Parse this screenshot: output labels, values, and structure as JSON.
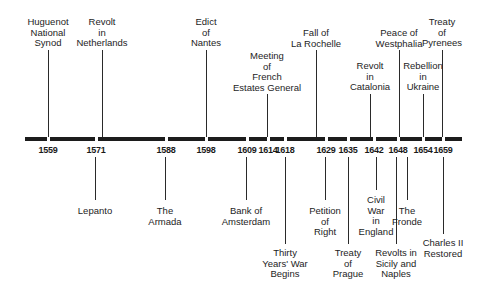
{
  "axis": {
    "start_x": 25,
    "end_x": 462,
    "ticks": [
      {
        "year": "1559",
        "x": 48
      },
      {
        "year": "1571",
        "x": 96
      },
      {
        "year": "1588",
        "x": 166
      },
      {
        "year": "1598",
        "x": 206
      },
      {
        "year": "1609",
        "x": 247
      },
      {
        "year": "1614",
        "x": 268
      },
      {
        "year": "1618",
        "x": 285
      },
      {
        "year": "1629",
        "x": 326
      },
      {
        "year": "1635",
        "x": 348
      },
      {
        "year": "1642",
        "x": 374
      },
      {
        "year": "1648",
        "x": 398
      },
      {
        "year": "1654",
        "x": 423
      },
      {
        "year": "1659",
        "x": 443
      }
    ]
  },
  "events_above": [
    {
      "text": "Huguenot\nNational\nSynod",
      "year": "1559",
      "x": 48,
      "text_top": 19,
      "line_top": 50,
      "line_bottom": 137
    },
    {
      "text": "Revolt\nin\nNetherlands",
      "year": "1571",
      "x": 102,
      "text_top": 19,
      "line_top": 50,
      "line_bottom": 137
    },
    {
      "text": "Edict\nof\nNantes",
      "year": "1598",
      "x": 206,
      "text_top": 19,
      "line_top": 50,
      "line_bottom": 137
    },
    {
      "text": "Meeting\nof\nFrench\nEstates General",
      "year": "1614",
      "x": 267,
      "text_top": 50,
      "line_top": 94,
      "line_bottom": 137
    },
    {
      "text": "Fall of\nLa Rochelle",
      "year": "1629",
      "x": 316,
      "text_top": 29,
      "line_top": 50,
      "line_bottom": 137
    },
    {
      "text": "Revolt\nin\nCatalonia",
      "year": "1642",
      "x": 370,
      "text_top": 61,
      "line_top": 94,
      "line_bottom": 137
    },
    {
      "text": "Peace of\nWestphalia",
      "year": "1648",
      "x": 399,
      "text_top": 29,
      "line_top": 50,
      "line_bottom": 137
    },
    {
      "text": "Rebellion\nin\nUkraine",
      "year": "1654",
      "x": 423,
      "text_top": 61,
      "line_top": 94,
      "line_bottom": 137
    },
    {
      "text": "Treaty\nof\nPyrenees",
      "year": "1659",
      "x": 442,
      "text_top": 19,
      "line_top": 50,
      "line_bottom": 137
    }
  ],
  "events_below": [
    {
      "text": "Lepanto",
      "year": "1571",
      "x": 95,
      "text_top": 206,
      "line_top": 157,
      "line_bottom": 200
    },
    {
      "text": "The\nArmada",
      "year": "1588",
      "x": 165,
      "text_top": 206,
      "line_top": 157,
      "line_bottom": 200
    },
    {
      "text": "Bank of\nAmsterdam",
      "year": "1609",
      "x": 246,
      "text_top": 206,
      "line_top": 157,
      "line_bottom": 200
    },
    {
      "text": "Thirty\nYears' War\nBegins",
      "year": "1618",
      "x": 285,
      "text_top": 248,
      "line_top": 157,
      "line_bottom": 244
    },
    {
      "text": "Petition\nof\nRight",
      "year": "1629",
      "x": 325,
      "text_top": 206,
      "line_top": 157,
      "line_bottom": 200
    },
    {
      "text": "Treaty\nof\nPrague",
      "year": "1635",
      "x": 348,
      "text_top": 248,
      "line_top": 157,
      "line_bottom": 244
    },
    {
      "text": "Civil\nWar\nin\nEngland",
      "year": "1642",
      "x": 376,
      "text_top": 195,
      "line_top": 157,
      "line_bottom": 190
    },
    {
      "text": "Revolts in\nSicily and\nNaples",
      "year": "1648",
      "x": 396,
      "text_top": 248,
      "line_top": 157,
      "line_bottom": 244
    },
    {
      "text": "The\nFronde",
      "year": "1648",
      "x": 407,
      "text_top": 206,
      "line_top": 157,
      "line_bottom": 200
    },
    {
      "text": "Charles II\nRestored",
      "year": "1659",
      "x": 443,
      "text_top": 238,
      "line_top": 157,
      "line_bottom": 234
    }
  ]
}
